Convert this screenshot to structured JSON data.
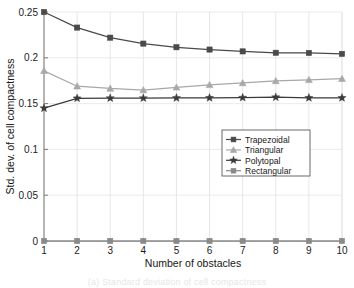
{
  "figure": {
    "caption_partial": "(a) Standard deviation of cell compactness"
  },
  "chart_data": {
    "type": "line",
    "title": "",
    "xlabel": "Number of obstacles",
    "ylabel": "Std. dev. of cell compactness",
    "x": [
      1,
      2,
      3,
      4,
      5,
      6,
      7,
      8,
      9,
      10
    ],
    "xlim": [
      1,
      10
    ],
    "ylim": [
      0,
      0.25
    ],
    "xticks": [
      "1",
      "2",
      "3",
      "4",
      "5",
      "6",
      "7",
      "8",
      "9",
      "10"
    ],
    "yticks": [
      "0",
      "0.05",
      "0.1",
      "0.15",
      "0.2",
      "0.25"
    ],
    "ytick_values": [
      0,
      0.05,
      0.1,
      0.15,
      0.2,
      0.25
    ],
    "grid": true,
    "legend_position": "center-right",
    "series": [
      {
        "name": "Trapezoidal",
        "marker": "square",
        "color": "#4a4a4a",
        "values": [
          0.25,
          0.233,
          0.222,
          0.2155,
          0.2115,
          0.209,
          0.207,
          0.2055,
          0.2053,
          0.2043
        ]
      },
      {
        "name": "Triangular",
        "marker": "triangle",
        "color": "#a8a8a8",
        "values": [
          0.1858,
          0.169,
          0.1665,
          0.1648,
          0.1678,
          0.1705,
          0.1725,
          0.1748,
          0.176,
          0.1772
        ]
      },
      {
        "name": "Polytopal",
        "marker": "star",
        "color": "#3a3a3a",
        "values": [
          0.145,
          0.1558,
          0.156,
          0.156,
          0.1562,
          0.1563,
          0.1565,
          0.157,
          0.1563,
          0.1563
        ]
      },
      {
        "name": "Rectangular",
        "marker": "square",
        "color": "#8a8a8a",
        "values": [
          0,
          0,
          0,
          0,
          0,
          0,
          0,
          0,
          0,
          0
        ]
      }
    ]
  }
}
